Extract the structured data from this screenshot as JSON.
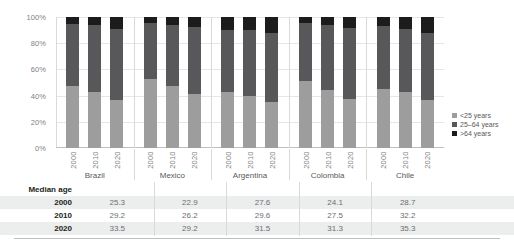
{
  "chart_data": {
    "type": "bar",
    "title": "",
    "xlabel": "",
    "ylabel": "",
    "ylim": [
      0,
      100
    ],
    "grid": true,
    "stacked": true,
    "stack_mode": "percent",
    "legend_position": "right",
    "y_ticks": [
      "0%",
      "20%",
      "40%",
      "60%",
      "80%",
      "100%"
    ],
    "legend": [
      "<25 years",
      "25–64 years",
      ">64 years"
    ],
    "groups": [
      "Brazil",
      "Mexico",
      "Argentina",
      "Colombia",
      "Chile"
    ],
    "sub_categories": [
      "2000",
      "2010",
      "2020"
    ],
    "series": [
      {
        "name": "<25 years",
        "color": "#9d9d9d",
        "values": [
          [
            47.5,
            42.5,
            36.5
          ],
          [
            53.0,
            47.5,
            41.5
          ],
          [
            42.5,
            40.0,
            35.5
          ],
          [
            51.0,
            44.0,
            37.5
          ],
          [
            45.0,
            42.5,
            36.5
          ]
        ]
      },
      {
        "name": "25–64 years",
        "color": "#58585a",
        "values": [
          [
            47.3,
            51.3,
            54.5
          ],
          [
            42.2,
            46.5,
            51.0
          ],
          [
            47.7,
            49.8,
            52.2
          ],
          [
            44.2,
            50.0,
            54.0
          ],
          [
            48.0,
            48.7,
            51.5
          ]
        ]
      },
      {
        "name": ">64 years",
        "color": "#1c1c1c",
        "values": [
          [
            5.2,
            6.2,
            9.0
          ],
          [
            4.8,
            6.0,
            7.5
          ],
          [
            9.8,
            10.2,
            12.3
          ],
          [
            4.8,
            6.0,
            8.5
          ],
          [
            7.0,
            8.8,
            12.0
          ]
        ]
      }
    ]
  },
  "legend": {
    "items": [
      {
        "label": "<25 years",
        "color": "#9d9d9d"
      },
      {
        "label": "25–64 years",
        "color": "#58585a"
      },
      {
        "label": ">64 years",
        "color": "#1c1c1c"
      }
    ]
  },
  "axis": {
    "y_ticks": [
      "100%",
      "80%",
      "60%",
      "40%",
      "20%",
      "0%"
    ]
  },
  "groups": [
    {
      "country": "Brazil",
      "years": [
        "2000",
        "2010",
        "2020"
      ]
    },
    {
      "country": "Mexico",
      "years": [
        "2000",
        "2010",
        "2020"
      ]
    },
    {
      "country": "Argentina",
      "years": [
        "2000",
        "2010",
        "2020"
      ]
    },
    {
      "country": "Colombia",
      "years": [
        "2000",
        "2010",
        "2020"
      ]
    },
    {
      "country": "Chile",
      "years": [
        "2000",
        "2010",
        "2020"
      ]
    }
  ],
  "table": {
    "title": "Median age",
    "rows": [
      {
        "label": "2000",
        "values": [
          "25.3",
          "22.9",
          "27.6",
          "24.1",
          "28.7"
        ]
      },
      {
        "label": "2010",
        "values": [
          "29.2",
          "26.2",
          "29.6",
          "27.5",
          "32.2"
        ]
      },
      {
        "label": "2020",
        "values": [
          "33.5",
          "29.2",
          "31.5",
          "31.3",
          "35.3"
        ]
      }
    ]
  }
}
